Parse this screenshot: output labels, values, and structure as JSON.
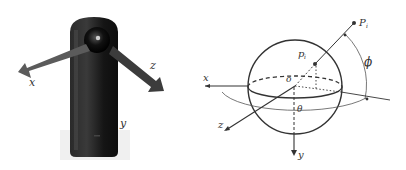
{
  "figure": {
    "left": {
      "title": "360 camera with device axes",
      "axes": {
        "x": "x",
        "y": "y",
        "z": "z"
      },
      "colors": {
        "body": "#1c1c1c",
        "arrow": "#555555"
      }
    },
    "right": {
      "title": "Spherical coordinate model",
      "labels": {
        "x": "x",
        "y": "y",
        "z": "z",
        "origin": "o",
        "point_world": "P",
        "point_world_sub": "i",
        "point_sphere": "p",
        "point_sphere_sub": "i",
        "phi": "ϕ",
        "theta": "θ"
      },
      "colors": {
        "line": "#333333"
      }
    }
  }
}
